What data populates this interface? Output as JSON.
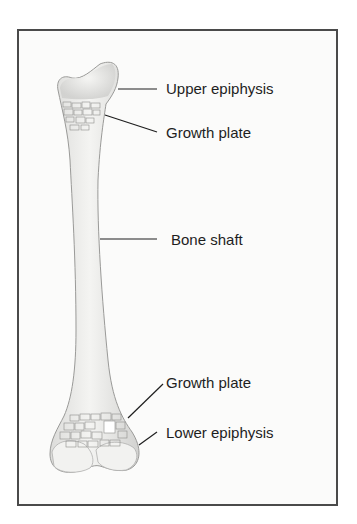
{
  "diagram": {
    "labels": [
      {
        "id": "upper-epiphysis",
        "text": "Upper epiphysis"
      },
      {
        "id": "upper-growth-plate",
        "text": "Growth plate"
      },
      {
        "id": "bone-shaft",
        "text": "Bone shaft"
      },
      {
        "id": "lower-growth-plate",
        "text": "Growth plate"
      },
      {
        "id": "lower-epiphysis",
        "text": "Lower epiphysis"
      }
    ],
    "colors": {
      "frame": "#4a4a4a",
      "bone_fill": "#ececea",
      "bone_outline": "#9a9a98",
      "plate_texture": "#8d8d8b",
      "leader_line": "#1e1e1e",
      "text": "#1e1e1e"
    }
  }
}
